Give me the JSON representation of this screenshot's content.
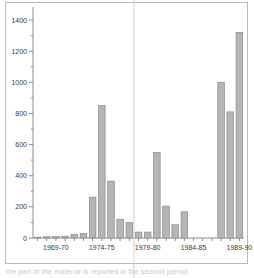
{
  "figure": {
    "frame_border_color": "#b9b9b9",
    "background_color": "#ffffff",
    "bar_fill_color": "#b5b5b5",
    "bar_edge_color": "#8a8a8a",
    "axis_color": "#8d8d8d",
    "divider_color": "#cfcfcf",
    "caption_partial": "the  part  of  the  material  is  reported  in  the  second  period"
  },
  "chart_data": {
    "type": "bar",
    "title": "",
    "subtitle": "",
    "xlabel": "",
    "ylabel": "",
    "ylim": [
      0,
      1400
    ],
    "yticks": [
      0,
      200,
      400,
      600,
      800,
      1000,
      1200,
      1400
    ],
    "ytick_labels": [
      "0",
      "200",
      "400",
      "600",
      "800",
      "1000",
      "1200",
      "1400"
    ],
    "y_minor_tick_step": 100,
    "grid": false,
    "legend": null,
    "legend_position": "none",
    "xtick_labels": [
      "1969-70",
      "1974-75",
      "1979-80",
      "1984-85",
      "1989-90"
    ],
    "xtick_categories": [
      "1969-70",
      "1974-75",
      "1979-80",
      "1984-85",
      "1989-90"
    ],
    "categories": [
      "1967-68",
      "1968-69",
      "1969-70",
      "1970-71",
      "1971-72",
      "1972-73",
      "1973-74",
      "1974-75",
      "1975-76",
      "1976-77",
      "1977-78",
      "1978-79",
      "1979-80",
      "1980-81",
      "1981-82",
      "1982-83",
      "1983-84",
      "1984-85",
      "1985-86",
      "1986-87",
      "1987-88",
      "1988-89",
      "1989-90"
    ],
    "values": [
      5,
      8,
      10,
      12,
      22,
      28,
      262,
      850,
      365,
      120,
      100,
      38,
      38,
      550,
      205,
      85,
      168,
      0,
      0,
      0,
      1000,
      810,
      1320
    ],
    "annotations": [
      {
        "type": "vertical-divider",
        "after_category": "1977-78",
        "label": ""
      }
    ]
  }
}
